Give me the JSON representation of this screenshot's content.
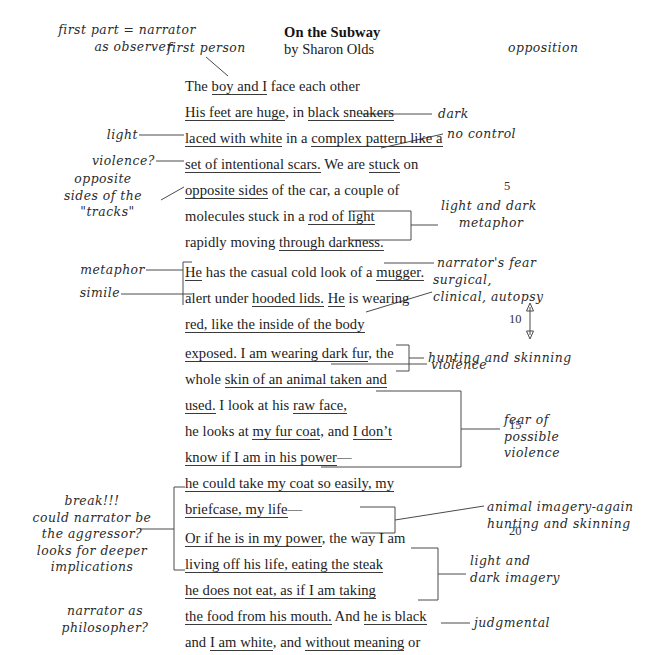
{
  "document": {
    "type": "annotated-poem-worksheet",
    "title": "On the Subway",
    "author": "by Sharon Olds"
  },
  "poem_lines": [
    {
      "n": 1,
      "top": 80,
      "segments": [
        {
          "t": "The ",
          "u": false
        },
        {
          "t": "boy and I",
          "u": true
        },
        {
          "t": " face each other",
          "u": false
        }
      ]
    },
    {
      "n": 2,
      "top": 106,
      "segments": [
        {
          "t": "His feet are huge",
          "u": true
        },
        {
          "t": ", in ",
          "u": false
        },
        {
          "t": "black sneakers",
          "u": true
        }
      ]
    },
    {
      "n": 3,
      "top": 132,
      "segments": [
        {
          "t": "laced with white",
          "u": true
        },
        {
          "t": " in a ",
          "u": false
        },
        {
          "t": "complex pattern like a",
          "u": true
        }
      ]
    },
    {
      "n": 4,
      "top": 158,
      "segments": [
        {
          "t": "set of intentional scars.",
          "u": true
        },
        {
          "t": " We are ",
          "u": false
        },
        {
          "t": "stuck",
          "u": true
        },
        {
          "t": " on",
          "u": false
        }
      ]
    },
    {
      "n": 5,
      "top": 184,
      "segments": [
        {
          "t": "opposite sides",
          "u": true
        },
        {
          "t": " of the car, a couple of",
          "u": false
        }
      ]
    },
    {
      "n": 6,
      "top": 210,
      "segments": [
        {
          "t": "molecules stuck in a ",
          "u": false
        },
        {
          "t": "rod of light",
          "u": true
        }
      ]
    },
    {
      "n": 7,
      "top": 236,
      "segments": [
        {
          "t": "rapidly moving ",
          "u": false
        },
        {
          "t": "through darkness.",
          "u": true
        }
      ]
    },
    {
      "n": 8,
      "top": 265,
      "segments": [
        {
          "t": "He",
          "u": true
        },
        {
          "t": " has the casual cold look of a ",
          "u": false
        },
        {
          "t": "mugger.",
          "u": true
        }
      ]
    },
    {
      "n": 9,
      "top": 291,
      "segments": [
        {
          "t": "alert under ",
          "u": false
        },
        {
          "t": "hooded lids.",
          "u": true
        },
        {
          "t": " ",
          "u": false
        },
        {
          "t": "He",
          "u": true
        },
        {
          "t": " is wearing",
          "u": false
        }
      ]
    },
    {
      "n": 10,
      "top": 317,
      "segments": [
        {
          "t": "red, like the inside of the body",
          "u": true
        }
      ]
    },
    {
      "n": 11,
      "top": 346,
      "segments": [
        {
          "t": "exposed. I am wearing dark fur",
          "u": true
        },
        {
          "t": ", the",
          "u": false
        }
      ]
    },
    {
      "n": 12,
      "top": 372,
      "segments": [
        {
          "t": "whole ",
          "u": false
        },
        {
          "t": "skin of an animal taken and",
          "u": true
        }
      ]
    },
    {
      "n": 13,
      "top": 398,
      "segments": [
        {
          "t": "used.",
          "u": true
        },
        {
          "t": " I look at his ",
          "u": false
        },
        {
          "t": "raw face,",
          "u": true
        }
      ]
    },
    {
      "n": 14,
      "top": 424,
      "segments": [
        {
          "t": "he looks at ",
          "u": false
        },
        {
          "t": "my fur coat",
          "u": true
        },
        {
          "t": ", and ",
          "u": false
        },
        {
          "t": "I don’t",
          "u": true
        }
      ]
    },
    {
      "n": 15,
      "top": 450,
      "segments": [
        {
          "t": "know if I am in his power",
          "u": true
        },
        {
          "t": "—",
          "u": false
        }
      ]
    },
    {
      "n": 16,
      "top": 476,
      "segments": [
        {
          "t": "he could take my coat so easily, my",
          "u": true
        }
      ]
    },
    {
      "n": 17,
      "top": 502,
      "segments": [
        {
          "t": "briefcase, my life",
          "u": true
        },
        {
          "t": "—",
          "u": false
        }
      ]
    },
    {
      "n": 18,
      "top": 531,
      "segments": [
        {
          "t": "Or if he is in my power",
          "u": true
        },
        {
          "t": ", the way I am",
          "u": false
        }
      ]
    },
    {
      "n": 19,
      "top": 557,
      "segments": [
        {
          "t": "living off his life, eating the steak",
          "u": true
        }
      ]
    },
    {
      "n": 20,
      "top": 583,
      "segments": [
        {
          "t": "he does not eat, as if I am taking",
          "u": true
        }
      ]
    },
    {
      "n": 21,
      "top": 609,
      "segments": [
        {
          "t": "the food from his mouth.",
          "u": true
        },
        {
          "t": " And ",
          "u": false
        },
        {
          "t": "he is black",
          "u": true
        }
      ]
    },
    {
      "n": 22,
      "top": 635,
      "segments": [
        {
          "t": "and ",
          "u": false
        },
        {
          "t": "I am white",
          "u": true
        },
        {
          "t": ", and ",
          "u": false
        },
        {
          "t": "without meaning",
          "u": true
        },
        {
          "t": " or",
          "u": false
        }
      ]
    },
    {
      "n": 23,
      "top": 661,
      "segments": [
        {
          "t": "trying to ",
          "u": false
        },
        {
          "t": "I must profit from his darkness,",
          "u": true
        }
      ]
    },
    {
      "n": 24,
      "top": 687,
      "segments": [
        {
          "t": "the way ",
          "u": false
        },
        {
          "t": "he absorbs the murderous beams of the",
          "u": true
        }
      ]
    }
  ],
  "line_numbers": [
    {
      "label": "5",
      "left": 504,
      "top": 179
    },
    {
      "label": "10",
      "left": 509,
      "top": 312
    },
    {
      "label": "15",
      "left": 509,
      "top": 418
    },
    {
      "label": "20",
      "left": 509,
      "top": 524
    }
  ],
  "annotations": {
    "first_part_narrator": "first part = narrator\n   as observer",
    "first_person": "first person",
    "opposition": "opposition",
    "dark": "dark",
    "light": "light",
    "no_control": "no control",
    "violence_q": "violence?",
    "opposite_sides_tracks": "opposite\nsides of the\n  \"tracks\"",
    "light_and_dark_metaphor": "light and dark\n    metaphor",
    "metaphor": "metaphor",
    "simile": "simile",
    "narrators_fear": "narrator's fear",
    "surgical_clinical_autopsy": "surgical,\nclinical, autopsy",
    "hunting_and_skinning": "hunting and skinning",
    "violence": "violence",
    "fear_of_possible_violence": "fear of\npossible\nviolence",
    "break_aggressor": "break!!!\ncould narrator be\nthe aggressor?\nlooks for deeper\nimplications",
    "animal_imagery_again": "animal imagery-again\nhunting and skinning",
    "light_and_dark_imagery": "light and\ndark imagery",
    "narrator_as_philosopher": "narrator as\nphilosopher?",
    "judgmental": "judgmental"
  },
  "colors": {
    "ink": "#1c1c1c",
    "annotation_ink": "#2b2b2b",
    "connector": "#4a4a4a",
    "background": "#ffffff"
  }
}
